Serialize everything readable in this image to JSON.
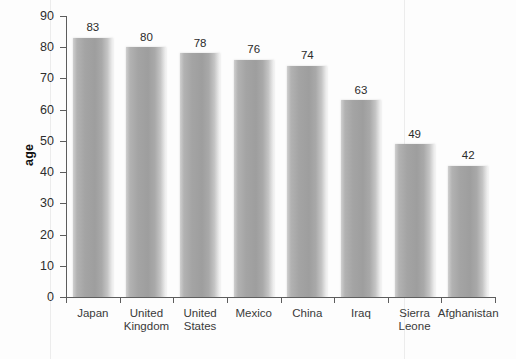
{
  "figure": {
    "y_axis_title": "age"
  },
  "chart_data": {
    "type": "bar",
    "title": "",
    "xlabel": "",
    "ylabel": "age",
    "ylim": [
      0,
      90
    ],
    "yticks": [
      0,
      10,
      20,
      30,
      40,
      50,
      60,
      70,
      80,
      90
    ],
    "ytick_labels": [
      "0",
      "10",
      "20",
      "30",
      "40",
      "50",
      "60",
      "70",
      "80",
      "90"
    ],
    "grid": false,
    "legend": null,
    "bar_color": "#a4a4a4",
    "categories": [
      "Japan",
      "United Kingdom",
      "United States",
      "Mexico",
      "China",
      "Iraq",
      "Sierra Leone",
      "Afghanistan"
    ],
    "category_lines": [
      [
        "Japan"
      ],
      [
        "United",
        "Kingdom"
      ],
      [
        "United",
        "States"
      ],
      [
        "Mexico"
      ],
      [
        "China"
      ],
      [
        "Iraq"
      ],
      [
        "Sierra",
        "Leone"
      ],
      [
        "Afghanistan"
      ]
    ],
    "values": [
      83,
      80,
      78,
      76,
      74,
      63,
      49,
      42
    ],
    "value_labels": [
      "83",
      "80",
      "78",
      "76",
      "74",
      "63",
      "49",
      "42"
    ]
  }
}
